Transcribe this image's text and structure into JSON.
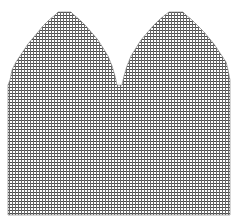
{
  "diagram": {
    "type": "knitting-chart-grid",
    "grid": {
      "cell_size_px": 3,
      "line_color": "#555555",
      "background_color": "#ffffff",
      "fill_color": "#c8c8c8"
    },
    "shape": {
      "outline_points": [
        [
          8,
          215
        ],
        [
          8,
          85
        ],
        [
          10,
          80
        ],
        [
          12,
          70
        ],
        [
          16,
          62
        ],
        [
          20,
          56
        ],
        [
          24,
          50
        ],
        [
          28,
          44
        ],
        [
          33,
          38
        ],
        [
          38,
          32
        ],
        [
          43,
          26
        ],
        [
          49,
          20
        ],
        [
          55,
          15
        ],
        [
          58,
          12
        ],
        [
          71,
          12
        ],
        [
          74,
          15
        ],
        [
          80,
          20
        ],
        [
          86,
          26
        ],
        [
          92,
          33
        ],
        [
          98,
          40
        ],
        [
          103,
          48
        ],
        [
          108,
          56
        ],
        [
          112,
          66
        ],
        [
          115,
          76
        ],
        [
          117,
          85
        ],
        [
          122,
          85
        ],
        [
          124,
          76
        ],
        [
          127,
          66
        ],
        [
          131,
          56
        ],
        [
          136,
          48
        ],
        [
          141,
          40
        ],
        [
          147,
          33
        ],
        [
          153,
          26
        ],
        [
          159,
          20
        ],
        [
          165,
          15
        ],
        [
          169,
          12
        ],
        [
          183,
          12
        ],
        [
          186,
          15
        ],
        [
          192,
          20
        ],
        [
          198,
          26
        ],
        [
          204,
          32
        ],
        [
          209,
          38
        ],
        [
          214,
          44
        ],
        [
          218,
          50
        ],
        [
          222,
          56
        ],
        [
          226,
          62
        ],
        [
          228,
          70
        ],
        [
          230,
          80
        ],
        [
          230,
          85
        ],
        [
          230,
          215
        ]
      ]
    }
  }
}
